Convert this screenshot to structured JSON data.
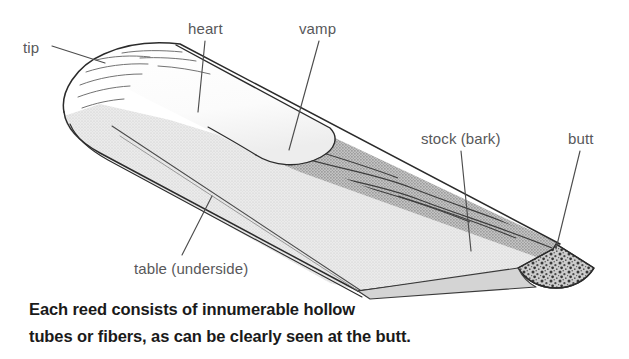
{
  "figure": {
    "background_color": "#ffffff",
    "line_color": "#2b2b2b",
    "label_color": "#58585a",
    "caption_color": "#1a1a1a",
    "bark_fill": "#b9b9b9",
    "table_fill": "#e2e2e2",
    "vamp_fill": "#ffffff",
    "butt_fill": "#c9c9c9",
    "labels": [
      {
        "id": "tip",
        "text": "tip",
        "x": 23,
        "y": 40
      },
      {
        "id": "heart",
        "text": "heart",
        "x": 188,
        "y": 21
      },
      {
        "id": "vamp",
        "text": "vamp",
        "x": 299,
        "y": 21
      },
      {
        "id": "stock",
        "text": "stock (bark)",
        "x": 421,
        "y": 131
      },
      {
        "id": "butt",
        "text": "butt",
        "x": 568,
        "y": 131
      },
      {
        "id": "table",
        "text": "table (underside)",
        "x": 134,
        "y": 261
      }
    ],
    "leaders": [
      {
        "id": "leader-tip",
        "x1": 52,
        "y1": 46,
        "x2": 105,
        "y2": 63
      },
      {
        "id": "leader-heart",
        "x1": 205,
        "y1": 41,
        "x2": 198,
        "y2": 112
      },
      {
        "id": "leader-vamp",
        "x1": 319,
        "y1": 41,
        "x2": 289,
        "y2": 150
      },
      {
        "id": "leader-stock",
        "x1": 461,
        "y1": 151,
        "x2": 471,
        "y2": 251
      },
      {
        "id": "leader-butt",
        "x1": 580,
        "y1": 151,
        "x2": 556,
        "y2": 249
      },
      {
        "id": "leader-table",
        "x1": 182,
        "y1": 255,
        "x2": 212,
        "y2": 196
      }
    ]
  },
  "caption": {
    "line_1": "Each reed consists of innumerable hollow",
    "line_2": "tubes or fibers, as can be clearly seen at the butt."
  }
}
